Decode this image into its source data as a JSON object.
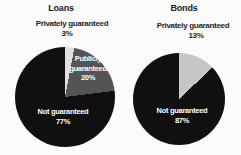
{
  "figure": {
    "background": "#fbfbfb",
    "text_color": "#1a1a1a",
    "inside_label_color": "#ffffff"
  },
  "chart_data": [
    {
      "type": "pie",
      "title": "Loans",
      "direction": "clockwise",
      "start_angle_deg": 0,
      "legend_position": "none",
      "slices": [
        {
          "label": "Privately guaranteed",
          "pct_label": "3%",
          "value": 3,
          "color": "#e0e0e0",
          "label_placement": "outside-top"
        },
        {
          "label": "Publicly guaranteed",
          "pct_label": "20%",
          "value": 20,
          "color": "#545454",
          "label_placement": "inside"
        },
        {
          "label": "Not guaranteed",
          "pct_label": "77%",
          "value": 77,
          "color": "#101010",
          "label_placement": "inside"
        }
      ]
    },
    {
      "type": "pie",
      "title": "Bonds",
      "direction": "clockwise",
      "start_angle_deg": 0,
      "legend_position": "none",
      "slices": [
        {
          "label": "Privately guaranteed",
          "pct_label": "13%",
          "value": 13,
          "color": "#c6c6c6",
          "label_placement": "outside-top"
        },
        {
          "label": "Not guaranteed",
          "pct_label": "87%",
          "value": 87,
          "color": "#101010",
          "label_placement": "inside"
        }
      ]
    }
  ]
}
